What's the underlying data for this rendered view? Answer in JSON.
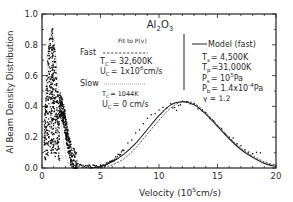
{
  "chart_data": {
    "type": "scatter",
    "title": "Al2O3",
    "title_parts": {
      "base": "Al",
      "sub1": "2",
      "mid": "O",
      "sub2": "3"
    },
    "xlabel": "Velocity (10^5cm/s)",
    "xlabel_parts": {
      "pre": "Velocity (10",
      "sup": "5",
      "post": "cm/s)"
    },
    "ylabel": "Al Beam Density Distribution",
    "xlim": [
      0,
      20
    ],
    "ylim": [
      0,
      1.0
    ],
    "xticks": [
      "0",
      "5",
      "10",
      "15",
      "20"
    ],
    "yticks": [
      "0.0",
      "0.2",
      "0.4",
      "0.6",
      "0.8",
      "1.0"
    ],
    "grid": false,
    "legend": {
      "fit_header": "Fit to P(v)",
      "fast_label": "Fast",
      "fast_tc": "T c = 32,600K",
      "fast_tc_parts": {
        "pre": "T",
        "sub": "C",
        "post": "= 32,600K"
      },
      "fast_uc_parts": {
        "pre": "U",
        "sub": "C",
        "mid": "= 1x10",
        "sup": "6",
        "post": "cm/s"
      },
      "slow_label": "Slow",
      "slow_tc_parts": {
        "pre": "T",
        "sub": "C",
        "post": "= 1044K"
      },
      "slow_uc_parts": {
        "pre": "U",
        "sub": "C",
        "post": "= 0 cm/s"
      },
      "model_label": "Model (fast)",
      "model_ts_parts": {
        "pre": "T",
        "sub": "s",
        "post": "= 4,500K"
      },
      "model_tp_parts": {
        "pre": "T",
        "sub": "p",
        "post": "=31,000K"
      },
      "model_ps_parts": {
        "pre": "P",
        "sub": "s",
        "mid": "= 10",
        "sup": "5",
        "post": "Pa"
      },
      "model_pb_parts": {
        "pre": "P",
        "sub": "b",
        "mid": "= 1.4x10",
        "sup": "-4",
        "post": "Pa"
      },
      "model_gamma": "γ = 1.2"
    },
    "series": [
      {
        "name": "Fast fit (dashed)",
        "style": "dashed",
        "x": [
          5,
          6,
          7,
          8,
          9,
          10,
          11,
          12,
          13,
          14,
          15,
          16,
          17,
          18,
          19,
          20
        ],
        "y": [
          0.0,
          0.02,
          0.06,
          0.13,
          0.22,
          0.31,
          0.39,
          0.43,
          0.42,
          0.36,
          0.28,
          0.2,
          0.13,
          0.08,
          0.04,
          0.02
        ]
      },
      {
        "name": "Model (fast) (solid)",
        "style": "solid",
        "x": [
          4,
          5,
          6,
          7,
          8,
          9,
          10,
          11,
          12,
          13,
          14,
          15,
          16,
          17,
          18,
          19,
          20
        ],
        "y": [
          0.0,
          0.01,
          0.04,
          0.09,
          0.16,
          0.25,
          0.34,
          0.41,
          0.43,
          0.41,
          0.35,
          0.27,
          0.19,
          0.12,
          0.07,
          0.03,
          0.01
        ]
      },
      {
        "name": "Slow fit (dotted)",
        "style": "dotted",
        "x": [
          0,
          0.25,
          0.5,
          0.75,
          1.0,
          1.25,
          1.5,
          1.75,
          2.0,
          2.25,
          2.5
        ],
        "y": [
          0.0,
          0.35,
          0.72,
          0.88,
          0.85,
          0.66,
          0.42,
          0.22,
          0.09,
          0.03,
          0.0
        ]
      },
      {
        "name": "Measured data (points)",
        "style": "points",
        "x": [
          0.2,
          0.4,
          0.6,
          0.8,
          0.9,
          1.0,
          1.2,
          1.4,
          1.6,
          1.8,
          2.0,
          2.2,
          2.5,
          3.0,
          4.0,
          5.0,
          6.0,
          7.0,
          8.0,
          9.0,
          10.0,
          11.0,
          11.5,
          12.0,
          13.0,
          14.0,
          15.0,
          16.0,
          17.0,
          18.0,
          19.0
        ],
        "y": [
          0.3,
          0.65,
          0.82,
          0.9,
          0.93,
          0.85,
          0.65,
          0.45,
          0.4,
          0.36,
          0.28,
          0.18,
          0.08,
          0.02,
          0.01,
          0.01,
          0.04,
          0.12,
          0.22,
          0.33,
          0.38,
          0.41,
          0.38,
          0.43,
          0.41,
          0.35,
          0.27,
          0.21,
          0.14,
          0.1,
          0.09
        ]
      }
    ]
  }
}
